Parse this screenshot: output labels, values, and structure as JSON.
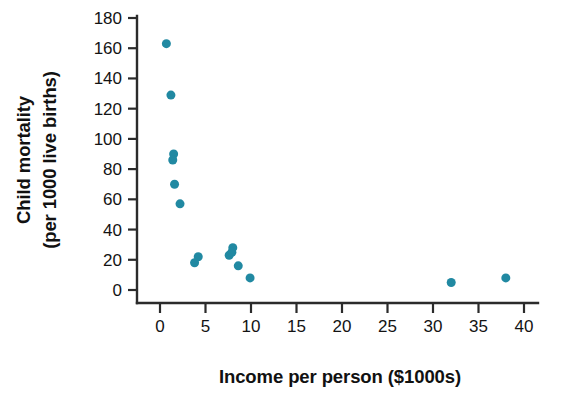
{
  "chart_data": {
    "type": "scatter",
    "title": "",
    "subtitle": "",
    "xlabel": "Income per person ($1000s)",
    "ylabel": "Child mortality\n(per 1000 live births)",
    "ylabel_line1": "Child mortality",
    "ylabel_line2": "(per 1000 live births)",
    "xlim": [
      -2,
      42
    ],
    "ylim": [
      -12,
      186
    ],
    "xticks": [
      0,
      5,
      10,
      15,
      20,
      25,
      30,
      35,
      40
    ],
    "xtick_labels": [
      "0",
      "5",
      "10",
      "15",
      "20",
      "25",
      "30",
      "35",
      "40"
    ],
    "yticks": [
      0,
      20,
      40,
      60,
      80,
      100,
      120,
      140,
      160,
      180
    ],
    "ytick_labels": [
      "0",
      "20",
      "40",
      "60",
      "80",
      "100",
      "120",
      "140",
      "160",
      "180"
    ],
    "grid": false,
    "legend": false,
    "legend_position": "none",
    "marker_color": "#2189a2",
    "marker_size": 9,
    "series": [
      {
        "name": "Countries",
        "color": "#2189a2",
        "points": [
          {
            "x": 0.7,
            "y": 163
          },
          {
            "x": 1.2,
            "y": 129
          },
          {
            "x": 1.5,
            "y": 90
          },
          {
            "x": 1.4,
            "y": 86
          },
          {
            "x": 1.6,
            "y": 70
          },
          {
            "x": 2.2,
            "y": 57
          },
          {
            "x": 3.8,
            "y": 18
          },
          {
            "x": 4.2,
            "y": 22
          },
          {
            "x": 7.6,
            "y": 23
          },
          {
            "x": 8.0,
            "y": 28
          },
          {
            "x": 7.9,
            "y": 25
          },
          {
            "x": 8.6,
            "y": 16
          },
          {
            "x": 9.9,
            "y": 8
          },
          {
            "x": 32.0,
            "y": 5
          },
          {
            "x": 38.0,
            "y": 8
          }
        ]
      }
    ]
  },
  "figure": {
    "background_color": "#ffffff",
    "axis_color": "#2b2b2b",
    "text_color": "#131313"
  }
}
